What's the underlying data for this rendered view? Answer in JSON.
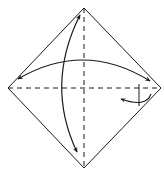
{
  "diagram": {
    "type": "origami-fold-diagram",
    "stroke_color": "#1a1a1a",
    "background": "#ffffff",
    "square": {
      "top": [
        84,
        8
      ],
      "right": [
        161,
        88
      ],
      "bottom": [
        84,
        168
      ],
      "left": [
        8,
        88
      ]
    },
    "valley_folds": [
      {
        "name": "vertical-diagonal",
        "from": [
          84,
          8
        ],
        "to": [
          84,
          168
        ]
      },
      {
        "name": "horizontal-diagonal",
        "from": [
          8,
          88
        ],
        "to": [
          161,
          88
        ]
      }
    ],
    "arrows": [
      {
        "name": "fold-left-right-arrow",
        "kind": "double-headed-curved"
      },
      {
        "name": "fold-top-bottom-arrow",
        "kind": "double-headed-curved"
      },
      {
        "name": "turn-over-arrow",
        "kind": "small-curved"
      }
    ]
  }
}
